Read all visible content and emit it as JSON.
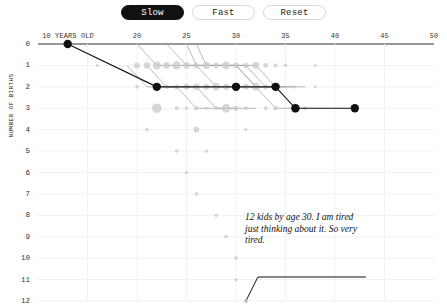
{
  "toolbar": {
    "buttons": [
      {
        "label": "Slow",
        "active": true
      },
      {
        "label": "Fast",
        "active": false
      },
      {
        "label": "Reset",
        "active": false
      }
    ]
  },
  "chart_data": {
    "type": "scatter",
    "title": "",
    "xlabel": "",
    "ylabel": "NUMBER OF BIRTHS",
    "xlim": [
      10,
      50
    ],
    "ylim": [
      0,
      12
    ],
    "grid": true,
    "legend_position": "none",
    "x_tick_labels": [
      {
        "value": 10,
        "label": "10 YEARS OLD"
      },
      {
        "value": 20,
        "label": "20"
      },
      {
        "value": 25,
        "label": "25"
      },
      {
        "value": 30,
        "label": "30"
      },
      {
        "value": 35,
        "label": "35"
      },
      {
        "value": 40,
        "label": "40"
      },
      {
        "value": 45,
        "label": "45"
      },
      {
        "value": 50,
        "label": "50"
      }
    ],
    "y_tick_labels": [
      "0",
      "1",
      "2",
      "3",
      "4",
      "5",
      "6",
      "7",
      "8",
      "9",
      "10",
      "11",
      "12"
    ],
    "annotations": [
      {
        "text": "12 kids by age 30. I am tired just thinking about it. So very tired.",
        "target_x": 31,
        "target_y": 12
      }
    ],
    "series": [
      {
        "name": "highlighted-mother",
        "color": "#111111",
        "points": [
          {
            "x": 13,
            "y": 0
          },
          {
            "x": 22,
            "y": 2
          },
          {
            "x": 30,
            "y": 2
          },
          {
            "x": 34,
            "y": 2
          },
          {
            "x": 36,
            "y": 3
          },
          {
            "x": 42,
            "y": 3
          }
        ]
      },
      {
        "name": "background-mothers",
        "color": "#c9c9c9",
        "points": [
          {
            "x": 16,
            "y": 1,
            "r": 1.6
          },
          {
            "x": 20,
            "y": 1,
            "r": 3.0
          },
          {
            "x": 21,
            "y": 1,
            "r": 3.2
          },
          {
            "x": 22,
            "y": 1,
            "r": 4.0
          },
          {
            "x": 23,
            "y": 1,
            "r": 3.4
          },
          {
            "x": 24,
            "y": 1,
            "r": 4.2
          },
          {
            "x": 25,
            "y": 1,
            "r": 3.4
          },
          {
            "x": 26,
            "y": 1,
            "r": 3.0
          },
          {
            "x": 27,
            "y": 1,
            "r": 3.6
          },
          {
            "x": 28,
            "y": 1,
            "r": 2.8
          },
          {
            "x": 29,
            "y": 1,
            "r": 3.8
          },
          {
            "x": 30,
            "y": 1,
            "r": 3.0
          },
          {
            "x": 31,
            "y": 1,
            "r": 2.6
          },
          {
            "x": 32,
            "y": 1,
            "r": 3.4
          },
          {
            "x": 33,
            "y": 1,
            "r": 2.4
          },
          {
            "x": 34,
            "y": 1,
            "r": 2.0
          },
          {
            "x": 35,
            "y": 1,
            "r": 1.8
          },
          {
            "x": 38,
            "y": 1,
            "r": 1.5
          },
          {
            "x": 20,
            "y": 2,
            "r": 1.8
          },
          {
            "x": 22,
            "y": 2,
            "r": 2.4
          },
          {
            "x": 23,
            "y": 2,
            "r": 2.2
          },
          {
            "x": 24,
            "y": 2,
            "r": 2.6
          },
          {
            "x": 25,
            "y": 2,
            "r": 3.0
          },
          {
            "x": 26,
            "y": 2,
            "r": 3.4
          },
          {
            "x": 27,
            "y": 2,
            "r": 3.0
          },
          {
            "x": 28,
            "y": 2,
            "r": 3.8
          },
          {
            "x": 29,
            "y": 2,
            "r": 3.2
          },
          {
            "x": 30,
            "y": 2,
            "r": 3.6
          },
          {
            "x": 31,
            "y": 2,
            "r": 3.0
          },
          {
            "x": 32,
            "y": 2,
            "r": 4.0
          },
          {
            "x": 33,
            "y": 2,
            "r": 2.6
          },
          {
            "x": 34,
            "y": 2,
            "r": 2.2
          },
          {
            "x": 36,
            "y": 2,
            "r": 1.6
          },
          {
            "x": 38,
            "y": 2,
            "r": 1.5
          },
          {
            "x": 22,
            "y": 3,
            "r": 4.8
          },
          {
            "x": 24,
            "y": 3,
            "r": 2.0
          },
          {
            "x": 25,
            "y": 3,
            "r": 1.8
          },
          {
            "x": 26,
            "y": 3,
            "r": 2.2
          },
          {
            "x": 27,
            "y": 3,
            "r": 1.8
          },
          {
            "x": 28,
            "y": 3,
            "r": 2.0
          },
          {
            "x": 29,
            "y": 3,
            "r": 4.4
          },
          {
            "x": 30,
            "y": 3,
            "r": 2.6
          },
          {
            "x": 31,
            "y": 3,
            "r": 2.0
          },
          {
            "x": 33,
            "y": 3,
            "r": 2.0
          },
          {
            "x": 34,
            "y": 3,
            "r": 2.2
          },
          {
            "x": 36,
            "y": 3,
            "r": 4.6
          },
          {
            "x": 37,
            "y": 3,
            "r": 2.0
          },
          {
            "x": 21,
            "y": 4,
            "r": 1.8
          },
          {
            "x": 26,
            "y": 4,
            "r": 2.8
          },
          {
            "x": 31,
            "y": 4,
            "r": 1.6
          },
          {
            "x": 24,
            "y": 5,
            "r": 1.8
          },
          {
            "x": 27,
            "y": 5,
            "r": 1.8
          },
          {
            "x": 25,
            "y": 6,
            "r": 1.8
          },
          {
            "x": 26,
            "y": 7,
            "r": 1.8
          },
          {
            "x": 28,
            "y": 8,
            "r": 1.8
          },
          {
            "x": 29,
            "y": 9,
            "r": 1.8
          },
          {
            "x": 30,
            "y": 10,
            "r": 1.8
          },
          {
            "x": 30,
            "y": 11,
            "r": 1.6
          },
          {
            "x": 31,
            "y": 12,
            "r": 1.6
          }
        ]
      },
      {
        "name": "background-paths",
        "color": "#9a9a9a",
        "paths": [
          [
            {
              "x": 20,
              "y": 0
            },
            {
              "x": 22,
              "y": 1
            },
            {
              "x": 26,
              "y": 1
            },
            {
              "x": 28,
              "y": 2
            },
            {
              "x": 34,
              "y": 2
            }
          ],
          [
            {
              "x": 23,
              "y": 0
            },
            {
              "x": 25,
              "y": 1
            },
            {
              "x": 30,
              "y": 1
            },
            {
              "x": 32,
              "y": 2
            },
            {
              "x": 35,
              "y": 2
            }
          ],
          [
            {
              "x": 25,
              "y": 0
            },
            {
              "x": 26,
              "y": 1
            },
            {
              "x": 31,
              "y": 1
            },
            {
              "x": 33,
              "y": 2
            },
            {
              "x": 36,
              "y": 2
            }
          ],
          [
            {
              "x": 26,
              "y": 0
            },
            {
              "x": 27,
              "y": 1
            },
            {
              "x": 32,
              "y": 1
            },
            {
              "x": 34,
              "y": 2
            },
            {
              "x": 37,
              "y": 2
            }
          ],
          [
            {
              "x": 19,
              "y": 1
            },
            {
              "x": 21,
              "y": 2
            },
            {
              "x": 24,
              "y": 2
            },
            {
              "x": 26,
              "y": 3
            },
            {
              "x": 30,
              "y": 3
            }
          ],
          [
            {
              "x": 21,
              "y": 1
            },
            {
              "x": 23,
              "y": 2
            },
            {
              "x": 26,
              "y": 2
            },
            {
              "x": 28,
              "y": 3
            },
            {
              "x": 32,
              "y": 3
            }
          ],
          [
            {
              "x": 30,
              "y": 1
            },
            {
              "x": 32,
              "y": 2
            },
            {
              "x": 34,
              "y": 3
            },
            {
              "x": 36,
              "y": 3
            }
          ]
        ]
      }
    ]
  }
}
